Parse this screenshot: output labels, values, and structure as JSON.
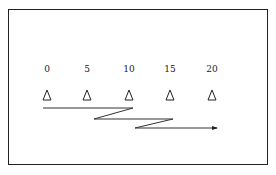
{
  "diagram": {
    "type": "zigzag-scan-path",
    "stations": [
      {
        "label": "0",
        "x": 47
      },
      {
        "label": "5",
        "x": 87
      },
      {
        "label": "10",
        "x": 129
      },
      {
        "label": "15",
        "x": 170
      },
      {
        "label": "20",
        "x": 212
      }
    ],
    "marker_icon": "triangle-outline",
    "path_points": [
      [
        43,
        108
      ],
      [
        133,
        108
      ],
      [
        94,
        119
      ],
      [
        173,
        119
      ],
      [
        135,
        128
      ],
      [
        218,
        128
      ]
    ],
    "colors": {
      "stroke": "#222222",
      "background": "#ffffff"
    }
  }
}
